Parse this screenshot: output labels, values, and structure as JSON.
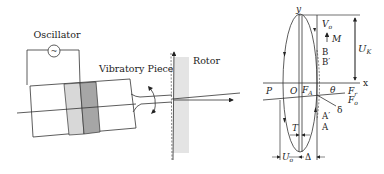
{
  "left_panel": {
    "oscillator_label": "Oscillator",
    "oscillator_symbol": "~",
    "vibratory_piece_label": "Vibratory Piece",
    "rotor_label": "Rotor",
    "colors": {
      "light_piezo": "#d8d8d8",
      "dark_piezo": "#a6a6a6",
      "rotor": "#e4e4e4",
      "line": "#333333"
    }
  },
  "right_panel": {
    "axis_y": "y",
    "axis_x": "x",
    "origin": "O",
    "P": "P",
    "F_A": "F",
    "F_A_sub": "A",
    "theta": "θ",
    "F_r": "F",
    "F_r_sub": "r",
    "F_o": "F",
    "F_o_sub": "o",
    "delta": "δ",
    "V_o": "V",
    "V_o_sub": "o",
    "M": "M",
    "B": "B",
    "B_prime": "B′",
    "A_prime": "A′",
    "A": "A",
    "U_K": "U",
    "U_K_sub": "K",
    "T": "T",
    "U_o": "U",
    "U_o_sub": "o",
    "Delta": "Δ"
  }
}
